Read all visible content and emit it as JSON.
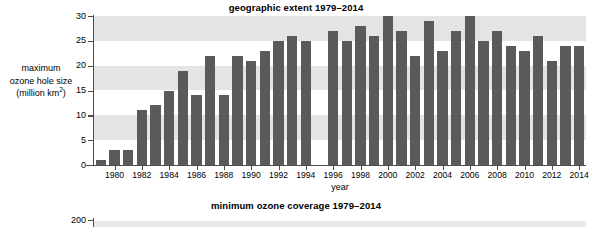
{
  "figure_one": {
    "title": "geographic extent 1979–2014",
    "y_caption_line1": "maximum",
    "y_caption_line2": "ozone hole size",
    "y_caption_line3_pre": "(million km",
    "y_caption_line3_sup": "2",
    "y_caption_line3_post": ")",
    "x_caption": "year"
  },
  "figure_two": {
    "title": "minimum ozone coverage 1979–2014",
    "first_ytick_label": "200"
  },
  "colors": {
    "bar": "#5a5a5a",
    "band": "#e4e4e4",
    "axis": "#4d4d4d",
    "background": "#ffffff"
  },
  "chart_data": {
    "type": "bar",
    "title": "geographic extent 1979–2014",
    "xlabel": "year",
    "ylabel": "maximum ozone hole size (million km2)",
    "ylim": [
      0,
      30
    ],
    "yticks": [
      0,
      5,
      10,
      15,
      20,
      25,
      30
    ],
    "ytick_labels": [
      "0",
      "5",
      "10",
      "15",
      "20",
      "25",
      "30"
    ],
    "xtick_labels": [
      "1980",
      "1982",
      "1984",
      "1986",
      "1988",
      "1990",
      "1992",
      "1994",
      "1996",
      "1998",
      "2000",
      "2002",
      "2004",
      "2006",
      "2008",
      "2010",
      "2012",
      "2014"
    ],
    "grid": "alternating horizontal shaded bands at 5-10, 15-20, 25-30",
    "legend": "none",
    "categories": [
      1979,
      1980,
      1981,
      1982,
      1983,
      1984,
      1985,
      1986,
      1987,
      1988,
      1989,
      1990,
      1991,
      1992,
      1993,
      1994,
      1995,
      1996,
      1997,
      1998,
      1999,
      2000,
      2001,
      2002,
      2003,
      2004,
      2005,
      2006,
      2007,
      2008,
      2009,
      2010,
      2011,
      2012,
      2013,
      2014
    ],
    "values": [
      1,
      3,
      3,
      11,
      12,
      15,
      19,
      14,
      22,
      14,
      22,
      21,
      23,
      25,
      26,
      25,
      null,
      27,
      25,
      28,
      26,
      30,
      27,
      22,
      29,
      23,
      27,
      30,
      25,
      27,
      24,
      23,
      26,
      21,
      24,
      24
    ],
    "missing_years": [
      1995
    ]
  },
  "chart_data_two": {
    "type": "bar",
    "title": "minimum ozone coverage 1979–2014",
    "ytick_labels": [
      "200"
    ],
    "notes": "second panel is cropped at the bottom edge of the screenshot; only the title and the topmost y tick (200) are visible"
  }
}
